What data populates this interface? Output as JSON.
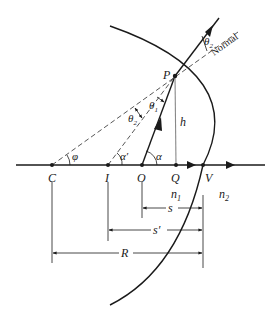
{
  "figure": {
    "points": {
      "C": "C",
      "I": "I",
      "O": "O",
      "Q": "Q",
      "V": "V",
      "P": "P"
    },
    "media": {
      "n1": "n",
      "n1_sub": "1",
      "n2": "n",
      "n2_sub": "2"
    },
    "angles": {
      "phi": "φ",
      "alpha_prime": "α′",
      "alpha": "α",
      "theta1": "θ",
      "theta1_sub": "1",
      "theta2": "θ",
      "theta2_sub": "2",
      "theta2_out": "θ",
      "theta2_out_sub": "2"
    },
    "lengths": {
      "h": "h",
      "s": "s",
      "s_prime": "s′",
      "R": "R"
    },
    "annotations": {
      "normal": "Normal"
    },
    "colors": {
      "line": "#1a1a1a",
      "height_line": "#888888",
      "dashed": "#444444"
    }
  }
}
